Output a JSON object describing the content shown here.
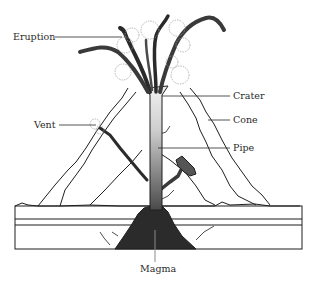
{
  "diagram": {
    "type": "labeled-illustration",
    "labels": [
      {
        "id": "eruption",
        "text": "Eruption"
      },
      {
        "id": "vent",
        "text": "Vent"
      },
      {
        "id": "crater",
        "text": "Crater"
      },
      {
        "id": "cone",
        "text": "Cone"
      },
      {
        "id": "pipe",
        "text": "Pipe"
      },
      {
        "id": "magma",
        "text": "Magma"
      }
    ],
    "colors": {
      "ink": "#1e1e1e",
      "magma": "#2b2b2b",
      "pipe_top": "#e6e6e6",
      "pipe_bottom": "#555555",
      "smoke": "#6a6a6a",
      "background": "#ffffff"
    }
  }
}
